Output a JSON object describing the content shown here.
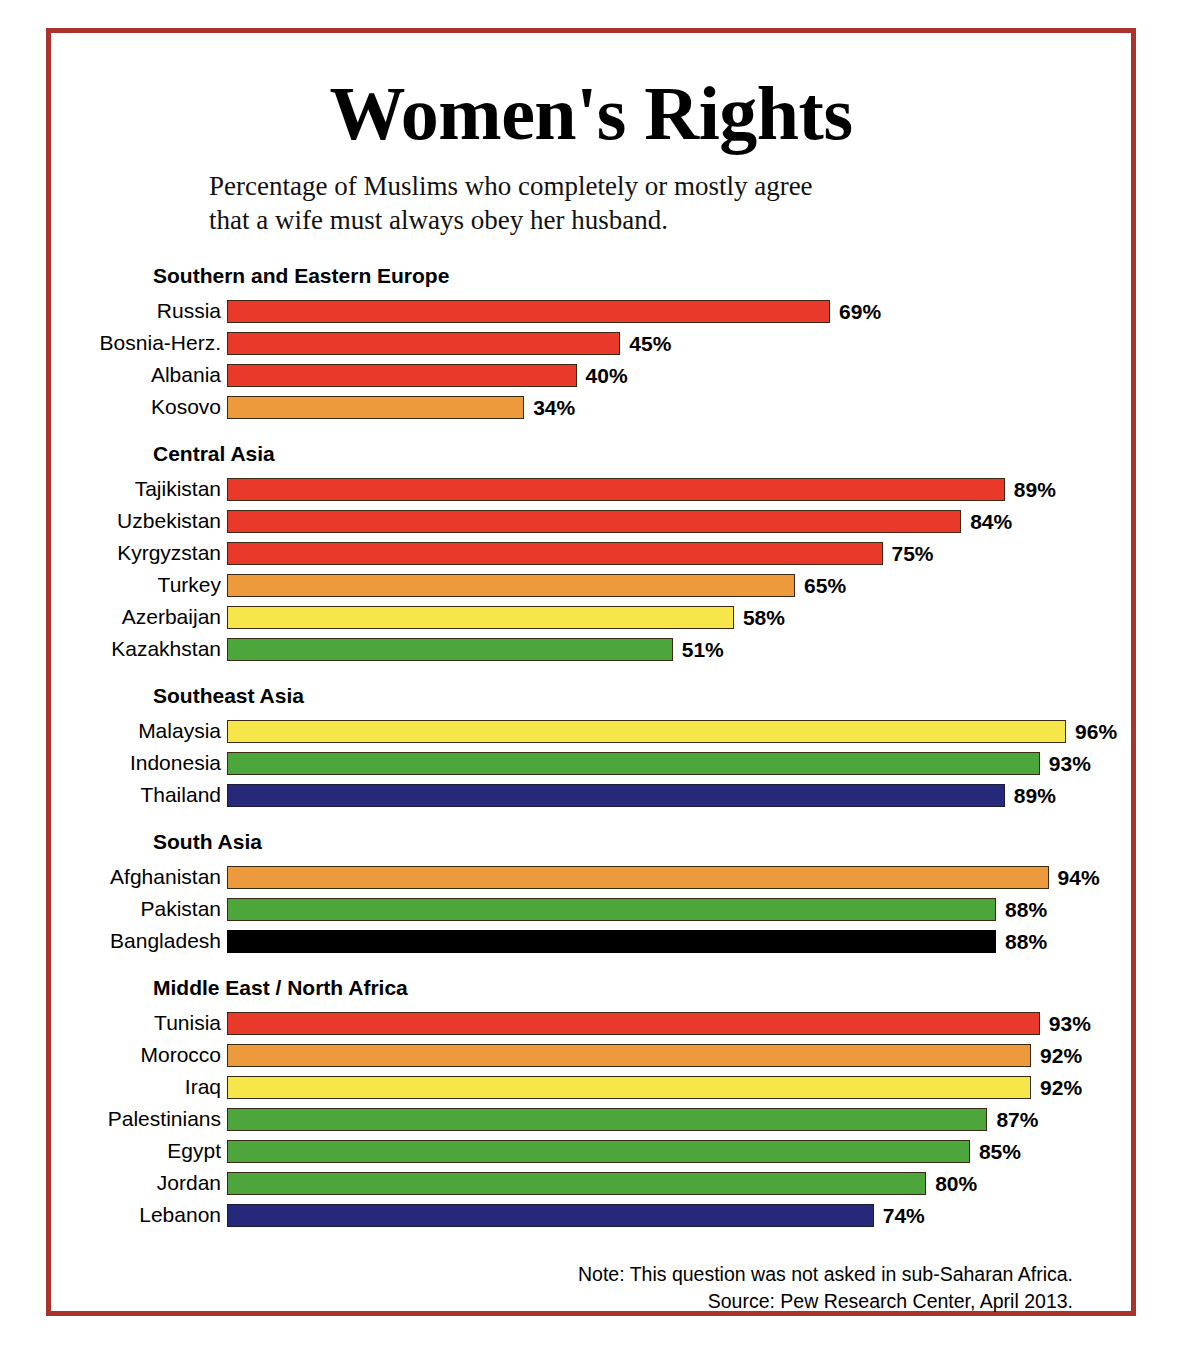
{
  "header": {
    "title": "Women's Rights",
    "subtitle_line1": "Percentage of Muslims who completely or mostly agree",
    "subtitle_line2": "that a wife must always obey her husband."
  },
  "footer": {
    "note": "Note: This question was not asked in sub-Saharan Africa.",
    "source": "Source: Pew Research Center, April 2013."
  },
  "colors": {
    "frame": "#a8342c",
    "red": "#e8392a",
    "orange": "#ed9a3d",
    "yellow": "#f7e64a",
    "green": "#4ca63c",
    "navy": "#26297a",
    "black": "#000000",
    "text": "#000000",
    "background": "#ffffff"
  },
  "chart_data": {
    "type": "bar",
    "orientation": "horizontal",
    "title": "Women's Rights",
    "subtitle": "Percentage of Muslims who completely or mostly agree that a wife must always obey her husband.",
    "xlabel": "",
    "ylabel": "",
    "xlim": [
      0,
      100
    ],
    "unit": "%",
    "grid": false,
    "legend": "none",
    "axis_ticks": [],
    "note": "Note: This question was not asked in sub-Saharan Africa.",
    "source": "Source: Pew Research Center, April 2013.",
    "groups": [
      {
        "name": "Southern and Eastern Europe",
        "categories": [
          "Russia",
          "Bosnia-Herz.",
          "Albania",
          "Kosovo"
        ],
        "values": [
          69,
          45,
          40,
          34
        ],
        "labels": [
          "69%",
          "45%",
          "40%",
          "34%"
        ],
        "colors": [
          "#e8392a",
          "#e8392a",
          "#e8392a",
          "#ed9a3d"
        ]
      },
      {
        "name": "Central Asia",
        "categories": [
          "Tajikistan",
          "Uzbekistan",
          "Kyrgyzstan",
          "Turkey",
          "Azerbaijan",
          "Kazakhstan"
        ],
        "values": [
          89,
          84,
          75,
          65,
          58,
          51
        ],
        "labels": [
          "89%",
          "84%",
          "75%",
          "65%",
          "58%",
          "51%"
        ],
        "colors": [
          "#e8392a",
          "#e8392a",
          "#e8392a",
          "#ed9a3d",
          "#f7e64a",
          "#4ca63c"
        ]
      },
      {
        "name": "Southeast Asia",
        "categories": [
          "Malaysia",
          "Indonesia",
          "Thailand"
        ],
        "values": [
          96,
          93,
          89
        ],
        "labels": [
          "96%",
          "93%",
          "89%"
        ],
        "colors": [
          "#f7e64a",
          "#4ca63c",
          "#26297a"
        ]
      },
      {
        "name": "South Asia",
        "categories": [
          "Afghanistan",
          "Pakistan",
          "Bangladesh"
        ],
        "values": [
          94,
          88,
          88
        ],
        "labels": [
          "94%",
          "88%",
          "88%"
        ],
        "colors": [
          "#ed9a3d",
          "#4ca63c",
          "#000000"
        ]
      },
      {
        "name": "Middle East / North Africa",
        "categories": [
          "Tunisia",
          "Morocco",
          "Iraq",
          "Palestinians",
          "Egypt",
          "Jordan",
          "Lebanon"
        ],
        "values": [
          93,
          92,
          92,
          87,
          85,
          80,
          74
        ],
        "labels": [
          "93%",
          "92%",
          "92%",
          "87%",
          "85%",
          "80%",
          "74%"
        ],
        "colors": [
          "#e8392a",
          "#ed9a3d",
          "#f7e64a",
          "#4ca63c",
          "#4ca63c",
          "#4ca63c",
          "#26297a"
        ]
      }
    ]
  }
}
